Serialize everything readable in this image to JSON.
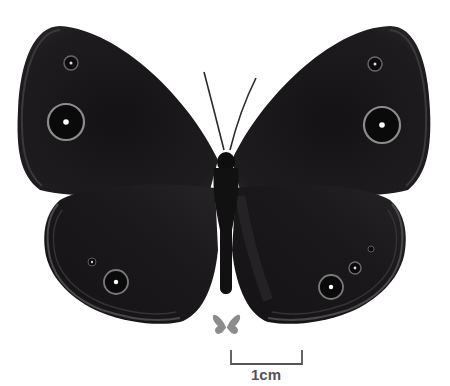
{
  "image": {
    "subject": "butterfly specimen, dorsal view",
    "background_color": "#ffffff",
    "wing_color": "#1c1a1c",
    "eyespot_ring_color": "#8a8a8a",
    "eyespot_pupil_color": "#ffffff"
  },
  "scale_bar": {
    "label": "1cm",
    "color": "#555555"
  },
  "size_reference_icon": {
    "name": "butterfly-silhouette",
    "color": "#8c8c8c"
  }
}
